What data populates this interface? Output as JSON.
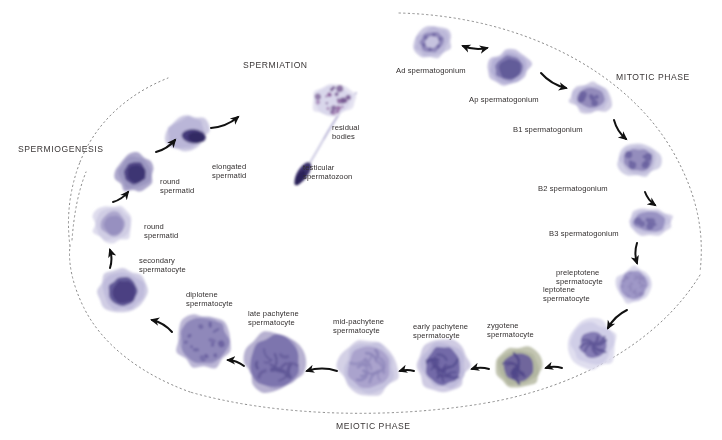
{
  "diagram": {
    "title_phases": [
      {
        "id": "spermiation",
        "label": "SPERMIATION",
        "x": 243,
        "y": 60
      },
      {
        "id": "spermiogenesis",
        "label": "SPERMIOGENESIS",
        "x": 18,
        "y": 144
      },
      {
        "id": "mitotic",
        "label": "MITOTIC PHASE",
        "x": 616,
        "y": 72
      },
      {
        "id": "meiotic",
        "label": "MEIOTIC PHASE",
        "x": 336,
        "y": 421
      }
    ],
    "cells": [
      {
        "id": "ad-spermatogonium",
        "label": "Ad spermatogonium",
        "label_x": 396,
        "label_y": 66,
        "cx": 432,
        "cy": 42,
        "rx": 20,
        "ry": 16,
        "rot": -20,
        "cyto": "#c9c6e0",
        "cyto2": "#b7b3d6",
        "nuc": "#8d85b8",
        "nuc2": "#6f67a3",
        "nrx": 12,
        "nry": 10,
        "pattern": "ring"
      },
      {
        "id": "ap-spermatogonium",
        "label": "Ap spermatogonium",
        "label_x": 469,
        "label_y": 95,
        "cx": 509,
        "cy": 68,
        "rx": 21,
        "ry": 17,
        "rot": -10,
        "cyto": "#c4c0de",
        "cyto2": "#aeaad2",
        "nuc": "#7c74ad",
        "nuc2": "#5d5695",
        "nrx": 14,
        "nry": 12,
        "pattern": "solid"
      },
      {
        "id": "b1-spermatogonium",
        "label": "B1 spermatogonium",
        "label_x": 513,
        "label_y": 125,
        "cx": 591,
        "cy": 98,
        "rx": 21,
        "ry": 15,
        "rot": 6,
        "cyto": "#cdc9e2",
        "cyto2": "#bcb8d9",
        "nuc": "#8f87b9",
        "nuc2": "#6a62a0",
        "nrx": 14,
        "nry": 10,
        "pattern": "speckle"
      },
      {
        "id": "b2-spermatogonium",
        "label": "B2 spermatogonium",
        "label_x": 538,
        "label_y": 184,
        "cx": 638,
        "cy": 160,
        "rx": 22,
        "ry": 16,
        "rot": 4,
        "cyto": "#cfcce4",
        "cyto2": "#bdb9da",
        "nuc": "#9089bb",
        "nuc2": "#6c64a1",
        "nrx": 15,
        "nry": 11,
        "pattern": "speckle"
      },
      {
        "id": "b3-spermatogonium",
        "label": "B3 spermatogonium",
        "label_x": 549,
        "label_y": 229,
        "cx": 650,
        "cy": 222,
        "rx": 22,
        "ry": 14,
        "rot": 0,
        "cyto": "#d3d0e6",
        "cyto2": "#c2bedd",
        "nuc": "#968fc0",
        "nuc2": "#726aa6",
        "nrx": 16,
        "nry": 10,
        "pattern": "speckle"
      },
      {
        "id": "preleptotene-spermatocyte",
        "label": "preleptotene\nspermatocyte",
        "label_x": 556,
        "label_y": 268,
        "cx": 634,
        "cy": 285,
        "rx": 17,
        "ry": 18,
        "rot": 0,
        "cyto": "#d8d6ea",
        "cyto2": "#c5c2e0",
        "nuc": "#9b94c4",
        "nuc2": "#8880b5",
        "nrx": 13,
        "nry": 14,
        "pattern": "fine"
      },
      {
        "id": "leptotene-spermatocyte",
        "label": "leptotene\nspermatocyte",
        "label_x": 543,
        "label_y": 285,
        "cx": 593,
        "cy": 344,
        "rx": 24,
        "ry": 24,
        "rot": 0,
        "cyto": "#dedcee",
        "cyto2": "#cbc8e4",
        "nuc": "#7e74b0",
        "nuc2": "#5f5697",
        "nrx": 13,
        "nry": 13,
        "pattern": "thread"
      },
      {
        "id": "zygotene-spermatocyte",
        "label": "zygotene\nspermatocyte",
        "label_x": 487,
        "label_y": 321,
        "cx": 518,
        "cy": 367,
        "rx": 24,
        "ry": 21,
        "rot": 0,
        "cyto": "#bfc2ad",
        "cyto2": "#aeb29c",
        "nuc": "#6a5f9c",
        "nuc2": "#50478a",
        "nrx": 15,
        "nry": 14,
        "pattern": "thread"
      },
      {
        "id": "early-pachytene-spermatocyte",
        "label": "early pachytene\nspermatocyte",
        "label_x": 413,
        "label_y": 322,
        "cx": 443,
        "cy": 366,
        "rx": 25,
        "ry": 26,
        "rot": 0,
        "cyto": "#ccc8e2",
        "cyto2": "#bab5d8",
        "nuc": "#6d64a4",
        "nuc2": "#554c8f",
        "nrx": 17,
        "nry": 19,
        "pattern": "coil"
      },
      {
        "id": "mid-pachytene-spermatocyte",
        "label": "mid-pachytene\nspermatocyte",
        "label_x": 333,
        "label_y": 317,
        "cx": 369,
        "cy": 367,
        "rx": 29,
        "ry": 28,
        "rot": 0,
        "cyto": "#d2cfe5",
        "cyto2": "#c0bddc",
        "nuc": "#a8a1cb",
        "nuc2": "#8e86ba",
        "nrx": 21,
        "nry": 21,
        "pattern": "coil"
      },
      {
        "id": "late-pachytene-spermatocyte",
        "label": "late pachytene\nspermatocyte",
        "label_x": 248,
        "label_y": 309,
        "cx": 275,
        "cy": 362,
        "rx": 29,
        "ry": 30,
        "rot": 0,
        "cyto": "#b3adcf",
        "cyto2": "#a09ac4",
        "nuc": "#7a71ab",
        "nuc2": "#5f5796",
        "nrx": 25,
        "nry": 26,
        "pattern": "coil"
      },
      {
        "id": "diplotene-spermatocyte",
        "label": "diplotene\nspermatocyte",
        "label_x": 186,
        "label_y": 290,
        "cx": 204,
        "cy": 341,
        "rx": 28,
        "ry": 27,
        "rot": 0,
        "cyto": "#b8b3d4",
        "cyto2": "#a7a1ca",
        "nuc": "#8d85b9",
        "nuc2": "#6a61a0",
        "nrx": 24,
        "nry": 23,
        "pattern": "blobs"
      },
      {
        "id": "secondary-spermatocyte",
        "label": "secondary\nspermatocyte",
        "label_x": 139,
        "label_y": 256,
        "cx": 123,
        "cy": 291,
        "rx": 24,
        "ry": 22,
        "rot": 0,
        "cyto": "#cdcae3",
        "cyto2": "#bbb7d9",
        "nuc": "#5c5294",
        "nuc2": "#463c7e",
        "nrx": 14,
        "nry": 14,
        "pattern": "solid"
      },
      {
        "id": "round-spermatid-lower",
        "label": "round\nspermatid",
        "label_x": 144,
        "label_y": 222,
        "cx": 113,
        "cy": 224,
        "rx": 20,
        "ry": 19,
        "rot": 0,
        "cyto": "#dcdaec",
        "cyto2": "#cbc8e2",
        "nuc": "#a9a3cb",
        "nuc2": "#938cbd",
        "nrx": 12,
        "nry": 12,
        "pattern": "solid"
      },
      {
        "id": "round-spermatid-upper",
        "label": "round\nspermatid",
        "label_x": 160,
        "label_y": 177,
        "cx": 135,
        "cy": 173,
        "rx": 19,
        "ry": 19,
        "rot": -15,
        "cyto": "#a9a3c9",
        "cyto2": "#9791bd",
        "nuc": "#4c4183",
        "nuc2": "#3b3170",
        "nrx": 11,
        "nry": 11,
        "pattern": "solid"
      },
      {
        "id": "elongated-spermatid",
        "label": "elongated\nspermatid",
        "label_x": 212,
        "label_y": 162,
        "cx": 186,
        "cy": 133,
        "rx": 22,
        "ry": 17,
        "rot": -22,
        "cyto": "#c9c6e0",
        "cyto2": "#b4b0d4",
        "nuc": "#453b7a",
        "nuc2": "#332a63",
        "nrx": 12,
        "nry": 7,
        "pattern": "tail-head"
      },
      {
        "id": "testicular-spermatozoon",
        "label": "testicular\nspermatozoon",
        "label_x": 303,
        "label_y": 163,
        "cx": 312,
        "cy": 140,
        "rx": 0,
        "ry": 0,
        "rot": 0,
        "cyto": "#c6c3de",
        "cyto2": "#b2aed3",
        "nuc": "#3a306c",
        "nuc2": "#2c2358",
        "nrx": 0,
        "nry": 0,
        "pattern": "sperm"
      },
      {
        "id": "residual-bodies",
        "label": "residual\nbodies",
        "label_x": 332,
        "label_y": 123,
        "cx": 333,
        "cy": 100,
        "rx": 22,
        "ry": 16,
        "rot": -12,
        "cyto": "#e4e2f0",
        "cyto2": "#d6d3e9",
        "nuc": "#8d5f9e",
        "nuc2": "#6f4f8b",
        "nrx": 0,
        "nry": 0,
        "pattern": "granules"
      }
    ],
    "arrows": [
      {
        "id": "arrow-ad-ap",
        "kind": "double",
        "x1": 463,
        "y1": 46,
        "x2": 487,
        "y2": 48
      },
      {
        "id": "arrow-ap-b1",
        "kind": "single",
        "x1": 541,
        "y1": 73,
        "x2": 566,
        "y2": 88
      },
      {
        "id": "arrow-b1-b2",
        "kind": "single",
        "x1": 614,
        "y1": 120,
        "x2": 626,
        "y2": 139
      },
      {
        "id": "arrow-b2-b3",
        "kind": "single",
        "x1": 645,
        "y1": 192,
        "x2": 655,
        "y2": 205
      },
      {
        "id": "arrow-b3-preleptotene",
        "kind": "single",
        "x1": 637,
        "y1": 243,
        "x2": 637,
        "y2": 263
      },
      {
        "id": "arrow-preleptotene-leptotene",
        "kind": "single",
        "x1": 627,
        "y1": 310,
        "x2": 608,
        "y2": 328
      },
      {
        "id": "arrow-leptotene-zygotene",
        "kind": "single",
        "x1": 562,
        "y1": 368,
        "x2": 546,
        "y2": 368
      },
      {
        "id": "arrow-zygotene-early",
        "kind": "single",
        "x1": 489,
        "y1": 369,
        "x2": 472,
        "y2": 369
      },
      {
        "id": "arrow-early-mid",
        "kind": "single",
        "x1": 414,
        "y1": 371,
        "x2": 400,
        "y2": 371
      },
      {
        "id": "arrow-mid-late",
        "kind": "single",
        "x1": 337,
        "y1": 371,
        "x2": 307,
        "y2": 371
      },
      {
        "id": "arrow-late-diplotene",
        "kind": "single",
        "x1": 244,
        "y1": 366,
        "x2": 228,
        "y2": 360
      },
      {
        "id": "arrow-diplotene-secondary",
        "kind": "single",
        "x1": 172,
        "y1": 332,
        "x2": 152,
        "y2": 320
      },
      {
        "id": "arrow-secondary-round",
        "kind": "single",
        "x1": 110,
        "y1": 268,
        "x2": 110,
        "y2": 250
      },
      {
        "id": "arrow-round-round",
        "kind": "single",
        "x1": 113,
        "y1": 202,
        "x2": 128,
        "y2": 192
      },
      {
        "id": "arrow-round-elongated",
        "kind": "single",
        "x1": 156,
        "y1": 152,
        "x2": 175,
        "y2": 140
      },
      {
        "id": "arrow-elongated-spermatozoon",
        "kind": "single",
        "x1": 211,
        "y1": 128,
        "x2": 238,
        "y2": 117
      }
    ],
    "boundaries": [
      {
        "id": "mitotic-meiotic-arc",
        "desc": "dotted outer arc right"
      },
      {
        "id": "meiotic-arc-bottom",
        "desc": "dotted arc bottom"
      },
      {
        "id": "spermiogenesis-arc",
        "desc": "dotted arc left"
      },
      {
        "id": "spermiation-arc",
        "desc": "dotted arc top-left"
      }
    ]
  },
  "colors": {
    "text": "#332f2f",
    "phase_text": "#3a3636",
    "dotted": "#8c8c8c",
    "arrow": "#111111",
    "cyto_generic": "#cbc8e2",
    "nucleus_generic": "#6f67a3",
    "zygotene_cyto": "#bfc2ad"
  }
}
